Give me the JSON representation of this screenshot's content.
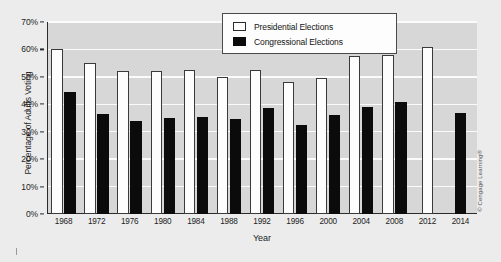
{
  "chart_data": {
    "type": "bar",
    "title": "",
    "xlabel": "Year",
    "ylabel": "Percentage of Adults Voting",
    "ylim": [
      0,
      70
    ],
    "ytick_labels": [
      "0%",
      "10%",
      "20%",
      "30%",
      "40%",
      "50%",
      "60%",
      "70%"
    ],
    "ytick_values": [
      0,
      10,
      20,
      30,
      40,
      50,
      60,
      70
    ],
    "grid": true,
    "legend_position": "top-center",
    "categories": [
      "1968",
      "1972",
      "1976",
      "1980",
      "1984",
      "1988",
      "1992",
      "1996",
      "2000",
      "2004",
      "2008",
      "2012",
      "2014"
    ],
    "series": [
      {
        "name": "Presidential Elections",
        "color": "#ffffff",
        "values": [
          60,
          55,
          52,
          52,
          52.5,
          50,
          52.5,
          48,
          49.5,
          57.5,
          58,
          61,
          null
        ]
      },
      {
        "name": "Congressional Elections",
        "color": "#0b0b0b",
        "values": [
          44.5,
          36.5,
          34,
          35,
          35.5,
          34.5,
          38.5,
          32.5,
          36,
          39,
          41,
          null,
          37
        ]
      }
    ]
  },
  "axes": {
    "y_title": "Percentage of Adults Voting",
    "x_title": "Year"
  },
  "legend": {
    "items": [
      {
        "label": "Presidential Elections",
        "swatch": "white-square"
      },
      {
        "label": "Congressional Elections",
        "swatch": "black-square"
      }
    ]
  },
  "credit": {
    "text": "© Cengage Learning®"
  },
  "colors": {
    "figure_background": "#ececec",
    "plot_background": "#d7d7d7",
    "gridline": "#fbfbfb",
    "axis": "#2b2b2b",
    "presidential_bar": "#ffffff",
    "congressional_bar": "#0b0b0b"
  }
}
